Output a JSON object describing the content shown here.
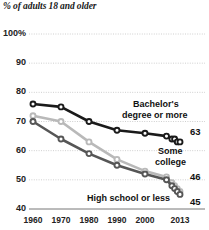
{
  "chart_data": {
    "type": "line",
    "title": "% of adults 18 and older",
    "xlabel": "",
    "ylabel": "",
    "xlim": [
      1960,
      2013
    ],
    "ylim": [
      40,
      100
    ],
    "yticks": [
      40,
      50,
      60,
      70,
      80,
      90,
      100
    ],
    "ytick_labels": [
      "40",
      "50",
      "60",
      "70",
      "80",
      "90",
      "100%"
    ],
    "xticks": [
      1960,
      1970,
      1980,
      1990,
      2000,
      2013
    ],
    "xtick_labels": [
      "1960",
      "1970",
      "1980",
      "1990",
      "2000",
      "2013"
    ],
    "grid": true,
    "legend_position": "inline-right",
    "series": [
      {
        "name": "Bachelor's degree or more",
        "label_line1": "Bachelor's",
        "label_line2": "degree or more",
        "color": "#1a1a1a",
        "end_value": "63",
        "x": [
          1960,
          1970,
          1980,
          1990,
          2000,
          2008,
          2010,
          2011,
          2012,
          2013
        ],
        "values": [
          76,
          75,
          70,
          67,
          66,
          65,
          64,
          64,
          63,
          63
        ]
      },
      {
        "name": "Some college",
        "label_line1": "Some",
        "label_line2": "college",
        "color": "#b9b9b9",
        "end_value": "46",
        "x": [
          1960,
          1970,
          1980,
          1990,
          2000,
          2008,
          2010,
          2011,
          2012,
          2013
        ],
        "values": [
          72,
          70,
          63,
          57,
          53,
          51,
          49,
          48,
          47,
          46
        ]
      },
      {
        "name": "High school or less",
        "label_line1": "High school or less",
        "label_line2": "",
        "color": "#565656",
        "end_value": "45",
        "x": [
          1960,
          1970,
          1980,
          1990,
          2000,
          2008,
          2010,
          2011,
          2012,
          2013
        ],
        "values": [
          70,
          64,
          59,
          55,
          52,
          50,
          48,
          47,
          46,
          45
        ]
      }
    ]
  }
}
